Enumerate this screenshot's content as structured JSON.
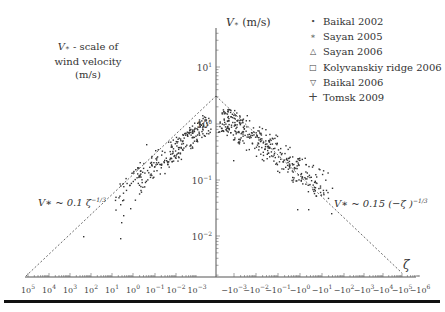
{
  "chart_data": {
    "type": "scatter",
    "title": "",
    "ylabel": "V* (m/s)",
    "xlabel": "ζ",
    "y_scale": "log",
    "ylim": [
      0.001,
      30
    ],
    "y_ticks": [
      "10^1",
      "10^0",
      "10^-1",
      "10^-2"
    ],
    "x_ticks_left": [
      "10^5",
      "10^4",
      "10^3",
      "10^2",
      "10^1",
      "10^0",
      "10^-1",
      "10^-2",
      "10^-3"
    ],
    "x_ticks_right": [
      "-10^-3",
      "-10^-2",
      "-10^-1",
      "-10^0",
      "-10^1",
      "-10^2",
      "-10^3",
      "-10^4",
      "-10^5",
      "-10^6"
    ],
    "annotation_top_left": [
      "V* - scale of",
      "wind velocity (m/s)"
    ],
    "fit_left": "V* ~ 0.1 ζ^-1/3",
    "fit_right": "V* ~ 0.15 (-ζ)^-1/3",
    "legend": [
      "Baikal 2002",
      "Sayan 2005",
      "Sayan 2006",
      "Kolyvanskiy ridge 2006",
      "Baikal 2006",
      "Tomsk 2009"
    ],
    "legend_position": "upper right",
    "grid": false,
    "series_summary": [
      {
        "name": "stable (ζ>0)",
        "x_range": [
          10,
          0.001
        ],
        "y_range": [
          0.009,
          1.0
        ]
      },
      {
        "name": "unstable (ζ<0)",
        "x_range": [
          -0.001,
          -10
        ],
        "y_range": [
          0.03,
          1.0
        ]
      }
    ]
  },
  "labels": {
    "y_axis_title_var": "V",
    "y_axis_title_unit": "(m/s)",
    "annotation_line1_var": "V",
    "annotation_line1_rest": " - scale of",
    "annotation_line2": "wind velocity (m/s)",
    "fit_left": "V∗ ~ 0.1 ζ",
    "fit_left_exp": "−1/3",
    "fit_right": "V∗ ~ 0.15 (−ζ )",
    "fit_right_exp": "−1/3",
    "zeta": "ζ"
  },
  "legend": [
    {
      "mark": "•",
      "label": "Baikal 2002"
    },
    {
      "mark": "∗",
      "label": "Sayan 2005"
    },
    {
      "mark": "△",
      "label": "Sayan 2006"
    },
    {
      "mark": "□",
      "label": "Kolyvanskiy ridge 2006"
    },
    {
      "mark": "▽",
      "label": "Baikal 2006"
    },
    {
      "mark": "+",
      "label": "Tomsk 2009"
    }
  ],
  "yticks": [
    {
      "base": "10",
      "exp": "1",
      "y": 67
    },
    {
      "base": "10",
      "exp": "0",
      "y": 124
    },
    {
      "base": "10",
      "exp": "−1",
      "y": 180
    },
    {
      "base": "10",
      "exp": "−2",
      "y": 236
    }
  ],
  "xticks": [
    {
      "base": "10",
      "exp": "5",
      "x": 28
    },
    {
      "base": "10",
      "exp": "4",
      "x": 49
    },
    {
      "base": "10",
      "exp": "3",
      "x": 70
    },
    {
      "base": "10",
      "exp": "2",
      "x": 91
    },
    {
      "base": "10",
      "exp": "1",
      "x": 112
    },
    {
      "base": "10",
      "exp": "0",
      "x": 133
    },
    {
      "base": "10",
      "exp": "−1",
      "x": 155
    },
    {
      "base": "10",
      "exp": "−2",
      "x": 176
    },
    {
      "base": "10",
      "exp": "−3",
      "x": 197
    },
    {
      "base": "−10",
      "exp": "−3",
      "x": 234
    },
    {
      "base": "−10",
      "exp": "−2",
      "x": 256
    },
    {
      "base": "−10",
      "exp": "−1",
      "x": 278
    },
    {
      "base": "−10",
      "exp": "0",
      "x": 300
    },
    {
      "base": "−10",
      "exp": "1",
      "x": 322
    },
    {
      "base": "−10",
      "exp": "2",
      "x": 344
    },
    {
      "base": "−10",
      "exp": "3",
      "x": 364
    },
    {
      "base": "−10",
      "exp": "4",
      "x": 383
    },
    {
      "base": "−10",
      "exp": "5",
      "x": 402
    },
    {
      "base": "−10",
      "exp": "6",
      "x": 420
    }
  ]
}
